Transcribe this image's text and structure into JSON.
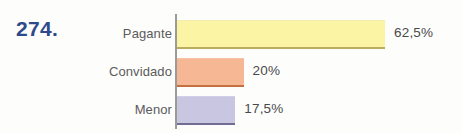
{
  "exercise": {
    "number": "274.",
    "number_color": "#2e4a8c"
  },
  "chart_data": {
    "type": "bar",
    "orientation": "horizontal",
    "title": "",
    "subtitle": "",
    "xlabel": "",
    "ylabel": "",
    "grid": false,
    "legend": "none",
    "axis_line": "vertical category axis at left of bars",
    "categories": [
      "Pagante",
      "Convidado",
      "Menor"
    ],
    "values": [
      62.5,
      20,
      17.5
    ],
    "value_labels": [
      "62,5%",
      "20%",
      "17,5%"
    ],
    "xlim": [
      0,
      72
    ],
    "series": [
      {
        "name": "Percentual",
        "values": [
          62.5,
          20,
          17.5
        ]
      }
    ],
    "bar_colors": [
      "#fbf4a4",
      "#f6b894",
      "#c8c6e0"
    ],
    "bar_border_colors": [
      "#b9ad5c",
      "#c2713f",
      "#6f6d93"
    ]
  }
}
